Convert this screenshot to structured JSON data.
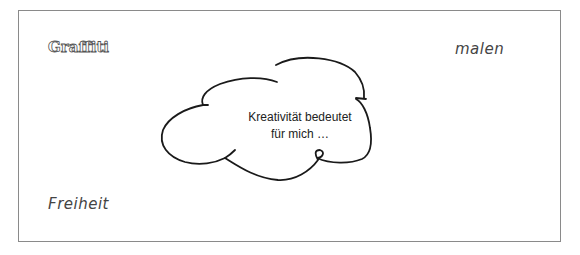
{
  "words": {
    "graffiti": "Graffiti",
    "malen": "malen",
    "freiheit": "Freiheit"
  },
  "cloud": {
    "line1": "Kreativität bedeutet",
    "line2": "für mich …"
  },
  "colors": {
    "frame": "#8a8a8a",
    "ink": "#1a1a1a"
  }
}
